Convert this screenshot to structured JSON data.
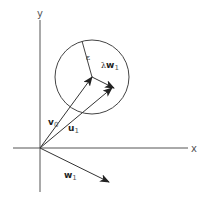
{
  "diagram": {
    "type": "vector-geometry",
    "colors": {
      "background": "#ffffff",
      "stroke": "#333333",
      "axis": "#555555",
      "text": "#333333"
    },
    "axes": {
      "x_label": "x",
      "y_label": "y"
    },
    "circle": {
      "radius_label": "ε"
    },
    "vectors": [
      {
        "id": "v0",
        "label_main": "v",
        "label_sub": "0"
      },
      {
        "id": "u1",
        "label_main": "u",
        "label_sub": "1"
      },
      {
        "id": "w1",
        "label_main": "w",
        "label_sub": "1"
      },
      {
        "id": "lambda_w1",
        "label_prefix": "λ",
        "label_main": "w",
        "label_sub": "1"
      }
    ]
  }
}
